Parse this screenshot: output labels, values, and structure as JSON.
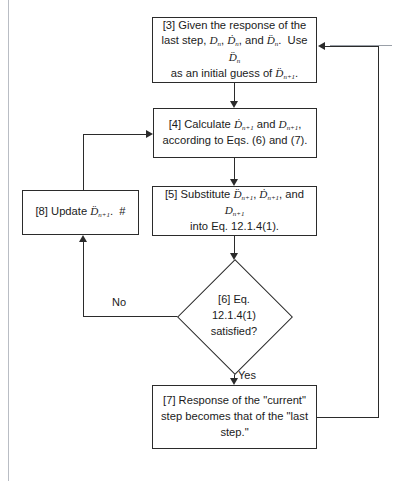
{
  "diagram": {
    "type": "flowchart",
    "line_color": "#2b2b2b",
    "frame_color": "#b9bdc4",
    "background": "#ffffff",
    "nodes": [
      {
        "id": "box3",
        "shape": "rectangle",
        "step": "[3]",
        "text": "[3] Given the response of the last step, Dn, Ḋn, and D̈n.  Use D̈n as an initial guess of D̈n+1."
      },
      {
        "id": "box4",
        "shape": "rectangle",
        "step": "[4]",
        "text": "[4] Calculate Ḋn+1 and Dn+1, according to Eqs. (6) and (7)."
      },
      {
        "id": "box5",
        "shape": "rectangle",
        "step": "[5]",
        "text": "[5] Substitute D̈n+1, Ḋn+1, and Dn+1 into Eq. 12.1.4(1)."
      },
      {
        "id": "box8",
        "shape": "rectangle",
        "step": "[8]",
        "text": "[8] Update D̈n+1.  #"
      },
      {
        "id": "diamond6",
        "shape": "diamond",
        "step": "[6]",
        "text": "[6] Eq.\n12.1.4(1)\nsatisfied?"
      },
      {
        "id": "box7",
        "shape": "rectangle",
        "step": "[7]",
        "text": "[7] Response of the \"current\" step becomes that of the \"last step.\""
      }
    ],
    "edge_labels": {
      "no": "No",
      "yes": "Yes"
    }
  }
}
